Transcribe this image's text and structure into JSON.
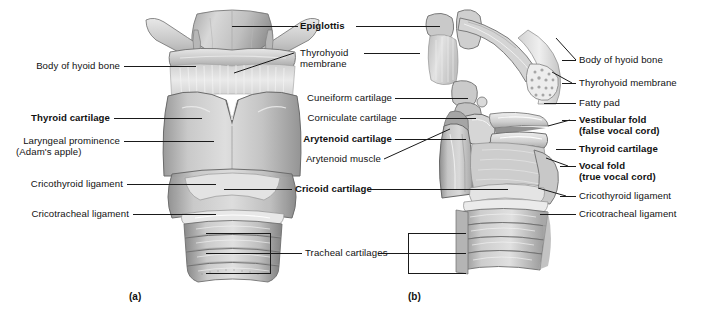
{
  "figure": {
    "panels": [
      {
        "id": "a",
        "caption": "(a)",
        "view": "anterior view"
      },
      {
        "id": "b",
        "caption": "(b)",
        "view": "sagittal view"
      }
    ]
  },
  "panel_a": {
    "caption": "(a)",
    "labels_left": [
      {
        "text": "Body of hyoid bone",
        "bold": false
      },
      {
        "text": "Thyroid cartilage",
        "bold": true
      },
      {
        "text": "Laryngeal prominence",
        "bold": false
      },
      {
        "text": "(Adam's apple)",
        "bold": false
      },
      {
        "text": "Cricothyroid ligament",
        "bold": false
      },
      {
        "text": "Cricotracheal ligament",
        "bold": false
      }
    ],
    "labels_right": [
      {
        "text": "Epiglottis",
        "bold": true
      },
      {
        "text": "Thyrohyoid",
        "bold": false
      },
      {
        "text": "membrane",
        "bold": false
      },
      {
        "text": "Cuneiform cartilage",
        "bold": false
      },
      {
        "text": "Corniculate cartilage",
        "bold": false
      },
      {
        "text": "Arytenoid cartilage",
        "bold": true
      },
      {
        "text": "Arytenoid muscle",
        "bold": false
      },
      {
        "text": "Cricoid cartilage",
        "bold": true
      },
      {
        "text": "Tracheal cartilages",
        "bold": false
      }
    ]
  },
  "panel_b": {
    "caption": "(b)",
    "labels_left": [
      {
        "text": "Tracheal cartilages",
        "bold": false
      }
    ],
    "labels_right": [
      {
        "text": "Body of hyoid bone",
        "bold": false
      },
      {
        "text": "Thyrohyoid membrane",
        "bold": false
      },
      {
        "text": "Fatty pad",
        "bold": false
      },
      {
        "text": "Vestibular fold",
        "bold": true
      },
      {
        "text": "(false vocal cord)",
        "bold": true
      },
      {
        "text": "Thyroid cartilage",
        "bold": true
      },
      {
        "text": "Vocal fold",
        "bold": true
      },
      {
        "text": "(true vocal cord)",
        "bold": true
      },
      {
        "text": "Cricothyroid ligament",
        "bold": false
      },
      {
        "text": "Cricotracheal ligament",
        "bold": false
      }
    ]
  },
  "text": {
    "body_of_hyoid_bone": "Body of hyoid bone",
    "thyroid_cartilage": "Thyroid cartilage",
    "laryngeal_prominence": "Laryngeal prominence",
    "adams_apple": "(Adam's apple)",
    "cricothyroid_ligament": "Cricothyroid ligament",
    "cricotracheal_ligament": "Cricotracheal ligament",
    "epiglottis": "Epiglottis",
    "thyrohyoid_1": "Thyrohyoid",
    "thyrohyoid_2": "membrane",
    "cuneiform_cartilage": "Cuneiform cartilage",
    "corniculate_cartilage": "Corniculate cartilage",
    "arytenoid_cartilage": "Arytenoid cartilage",
    "arytenoid_muscle": "Arytenoid muscle",
    "cricoid_cartilage": "Cricoid cartilage",
    "tracheal_cartilages": "Tracheal cartilages",
    "thyrohyoid_membrane": "Thyrohyoid membrane",
    "fatty_pad": "Fatty pad",
    "vestibular_fold": "Vestibular fold",
    "false_vocal_cord": "(false vocal cord)",
    "vocal_fold": "Vocal fold",
    "true_vocal_cord": "(true vocal cord)",
    "caption_a": "(a)",
    "caption_b": "(b)"
  },
  "colors": {
    "background": "#ffffff",
    "text": "#111111",
    "leader_line": "#1a1a1a",
    "cartilage_light": "#e2e2e2",
    "cartilage_mid": "#b8b8b8",
    "cartilage_dark": "#8d8d8d",
    "shadow": "#6b6b6b",
    "membrane": "#d5d5d5"
  }
}
